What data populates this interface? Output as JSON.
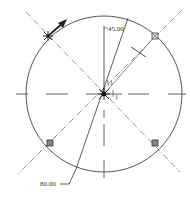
{
  "diagram": {
    "type": "cad-sketch-circle-pattern",
    "colors": {
      "background": "#ffffff",
      "geometry": "#555555",
      "centerline": "#777777",
      "dimension": "#333333",
      "marker": "#444444"
    },
    "circle": {
      "cx": 104,
      "cy": 94,
      "r": 78
    },
    "dimensions": {
      "angle_label": "45.00",
      "diameter_label": "80.00"
    },
    "constraint_labels": {
      "near_center_top": "1",
      "near_center_bottom": "1"
    },
    "points": [
      {
        "name": "point-top-left",
        "x": 48,
        "y": 36,
        "style": "asterisk"
      },
      {
        "name": "point-top-right",
        "x": 155,
        "y": 36,
        "style": "square"
      },
      {
        "name": "point-bottom-right",
        "x": 155,
        "y": 143,
        "style": "square"
      },
      {
        "name": "point-bottom-left",
        "x": 50,
        "y": 143,
        "style": "square"
      },
      {
        "name": "point-center",
        "x": 104,
        "y": 94,
        "style": "asterisk"
      }
    ]
  }
}
